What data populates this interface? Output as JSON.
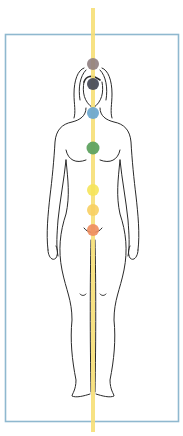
{
  "figure": {
    "title": "",
    "frame_color": "#8fb8cf",
    "line_color": "#f6df76",
    "outline_color": "#2a2a2a",
    "chakras": [
      {
        "name": "crown",
        "color": "#8f7e7f",
        "cy": 64
      },
      {
        "name": "third-eye",
        "color": "#4a4d5a",
        "cy": 84
      },
      {
        "name": "throat",
        "color": "#6fa9cf",
        "cy": 113
      },
      {
        "name": "heart",
        "color": "#5fa260",
        "cy": 148
      },
      {
        "name": "solar-plexus",
        "color": "#f5e45a",
        "cy": 190
      },
      {
        "name": "sacral",
        "color": "#f7cf62",
        "cy": 210
      },
      {
        "name": "root",
        "color": "#ee8d5e",
        "cy": 230
      }
    ]
  }
}
